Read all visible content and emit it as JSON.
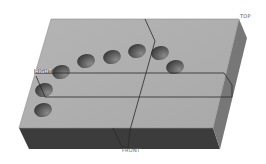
{
  "view": {
    "width": 266,
    "height": 164,
    "background": "#ffffff"
  },
  "labels": {
    "top": "TOP",
    "right": "RIGHT",
    "front": "FRONT"
  },
  "colors": {
    "top_face": "#a9a9a9",
    "top_face_light": "#b4b4b4",
    "right_face": "#777777",
    "front_face": "#3c3c3c",
    "plane_line": "#2a2a2a",
    "hole_dark": "#3a3a3a",
    "hole_light": "#8a8a8a",
    "edge": "#8f8f8f"
  },
  "block": {
    "top_face": [
      [
        51,
        19
      ],
      [
        239,
        19
      ],
      [
        213,
        128
      ],
      [
        19,
        128
      ]
    ],
    "right_face": [
      [
        239,
        19
      ],
      [
        247,
        38
      ],
      [
        220,
        149
      ],
      [
        213,
        128
      ]
    ],
    "front_face": [
      [
        19,
        128
      ],
      [
        213,
        128
      ],
      [
        220,
        149
      ],
      [
        29,
        149
      ]
    ]
  },
  "holes": [
    {
      "cx": 43,
      "cy": 110,
      "rx": 9,
      "ry": 7
    },
    {
      "cx": 44,
      "cy": 90,
      "rx": 9,
      "ry": 7
    },
    {
      "cx": 61,
      "cy": 72,
      "rx": 9,
      "ry": 7
    },
    {
      "cx": 86,
      "cy": 61,
      "rx": 9,
      "ry": 7
    },
    {
      "cx": 112,
      "cy": 57,
      "rx": 9,
      "ry": 7
    },
    {
      "cx": 137,
      "cy": 51,
      "rx": 9,
      "ry": 7
    },
    {
      "cx": 160,
      "cy": 53,
      "rx": 9,
      "ry": 7
    },
    {
      "cx": 175,
      "cy": 67,
      "rx": 9,
      "ry": 7
    }
  ],
  "planes": {
    "right_plane": [
      [
        36,
        73
      ],
      [
        224,
        73
      ],
      [
        232,
        85
      ],
      [
        232,
        97
      ],
      [
        45,
        97
      ],
      [
        36,
        76
      ]
    ],
    "front_plane": [
      [
        145,
        19
      ],
      [
        155,
        41
      ],
      [
        130,
        130
      ],
      [
        128,
        148
      ],
      [
        122,
        147
      ],
      [
        113,
        128
      ]
    ]
  }
}
